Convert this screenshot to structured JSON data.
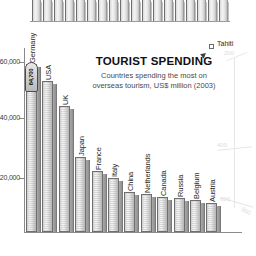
{
  "title": {
    "heading": "TOURIST SPENDING",
    "subtitle_line1": "Countries spending the most on",
    "subtitle_line2": "overseas tourism, US$ million (2003)"
  },
  "chart_data": {
    "type": "bar",
    "title": "TOURIST SPENDING",
    "subtitle": "Countries spending the most on overseas tourism, US$ million (2003)",
    "xlabel": "",
    "ylabel": "US$ million",
    "grid": false,
    "legend": "none",
    "categories": [
      "Germany",
      "USA",
      "UK",
      "Japan",
      "France",
      "Italy",
      "China",
      "Netherlands",
      "Canada",
      "Russia",
      "Belgium",
      "Austria"
    ],
    "values": [
      64700,
      58100,
      48500,
      28800,
      23400,
      20600,
      15200,
      14600,
      13400,
      12900,
      12400,
      11300
    ],
    "ytick_labels": [
      "$60,000",
      "$40,000",
      "$20,000"
    ],
    "ytick_values": [
      60000,
      40000,
      20000
    ],
    "ylim": [
      0,
      70000
    ],
    "leader_marker_text": "64,700"
  },
  "top_chart_fragment": {
    "description": "bottom edge of the bar chart from the preceding panel",
    "bar_count": 18
  },
  "map": {
    "place_label": "Tahiti",
    "contour_values": [
      "200",
      "400",
      "600",
      "800"
    ]
  },
  "colors": {
    "bar_face": "#e4e4e4",
    "bar_side": "#9a9a9a",
    "bar_outline": "#6f6f6f",
    "axis": "#8a8a8a",
    "title_text": "#111111",
    "subtitle_text": "#4a4a4a",
    "map_faint": "#e6e6e6"
  }
}
